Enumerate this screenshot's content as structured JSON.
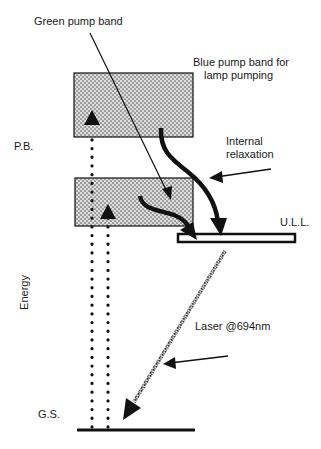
{
  "diagram": {
    "type": "energy-level-diagram",
    "labels": {
      "green_pump_band": "Green pump band",
      "blue_pump_band_line1": "Blue pump band for",
      "blue_pump_band_line2": "lamp pumping",
      "internal_relaxation_line1": "Internal",
      "internal_relaxation_line2": "relaxation",
      "pump_bands": "P.B.",
      "upper_laser_level": "U.L.L.",
      "energy_axis": "Energy",
      "laser_transition": "Laser @694nm",
      "ground_state": "G.S."
    },
    "levels": [
      {
        "name": "Blue pump band",
        "abbr": "P.B.",
        "style": "hatched-box"
      },
      {
        "name": "Green pump band",
        "abbr": "P.B.",
        "style": "hatched-box"
      },
      {
        "name": "Upper laser level",
        "abbr": "U.L.L.",
        "style": "thin-bar"
      },
      {
        "name": "Ground state",
        "abbr": "G.S.",
        "style": "line"
      }
    ],
    "transitions": [
      {
        "from": "G.S.",
        "to": "Blue pump band",
        "kind": "dotted-arrow-up"
      },
      {
        "from": "G.S.",
        "to": "Green pump band",
        "kind": "dotted-arrow-up"
      },
      {
        "from": "Blue pump band",
        "to": "U.L.L.",
        "kind": "thick-curved-arrow"
      },
      {
        "from": "Green pump band",
        "to": "U.L.L.",
        "kind": "thick-curved-arrow"
      },
      {
        "from": "U.L.L.",
        "to": "G.S.",
        "kind": "hatched-arrow",
        "label": "Laser @694nm"
      }
    ],
    "colors": {
      "ink": "#111111",
      "hatch_fill": "#8a8a8a",
      "background": "#ffffff"
    }
  }
}
